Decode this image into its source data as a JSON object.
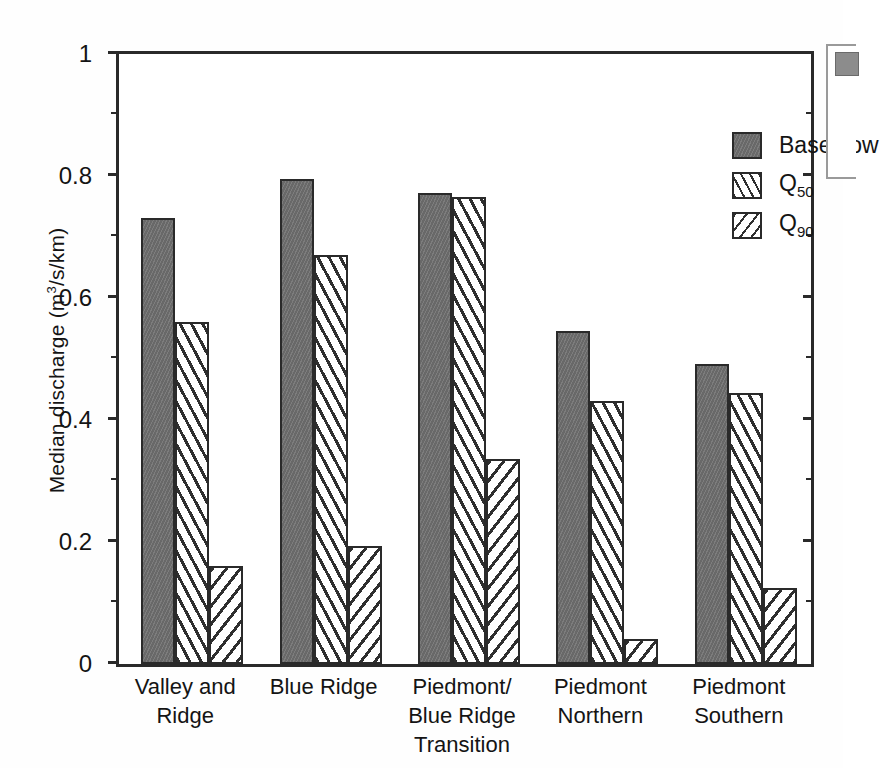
{
  "chart_data": {
    "type": "bar",
    "title": "",
    "xlabel": "",
    "ylabel": "Median discharge (m3/s/km)",
    "ylabel_parts": {
      "main": "Median discharge (m",
      "sup": "3",
      "tail": "/s/km)"
    },
    "ylim": [
      0,
      1
    ],
    "yticks": [
      0,
      0.2,
      0.4,
      0.6,
      0.8,
      1
    ],
    "ytick_labels": [
      "0",
      "0.2",
      "0.4",
      "0.6",
      "0.8",
      "1"
    ],
    "yminor_ticks": [
      0.1,
      0.3,
      0.5,
      0.7,
      0.9
    ],
    "grid": false,
    "legend_position": "top-right",
    "categories": [
      "Valley and\nRidge",
      "Blue Ridge",
      "Piedmont/\nBlue Ridge\nTransition",
      "Piedmont\nNorthern",
      "Piedmont\nSouthern"
    ],
    "category_lines": [
      [
        "Valley and",
        "Ridge"
      ],
      [
        "Blue Ridge"
      ],
      [
        "Piedmont/",
        "Blue Ridge",
        "Transition"
      ],
      [
        "Piedmont",
        "Northern"
      ],
      [
        "Piedmont",
        "Southern"
      ]
    ],
    "series": [
      {
        "name": "Base flow",
        "key": "base",
        "fill": "solid-gray",
        "color": "#6e6e6e",
        "values": [
          0.731,
          0.795,
          0.772,
          0.546,
          0.492
        ]
      },
      {
        "name": "Q50",
        "key": "q50",
        "fill": "hatch-steep",
        "color": "#ffffff",
        "values": [
          0.561,
          0.67,
          0.766,
          0.431,
          0.444
        ]
      },
      {
        "name": "Q90",
        "key": "q90",
        "fill": "hatch-shallow",
        "color": "#ffffff",
        "values": [
          0.161,
          0.193,
          0.336,
          0.041,
          0.125
        ]
      }
    ]
  },
  "legend": {
    "entries": [
      {
        "label": "Base flow",
        "sub": ""
      },
      {
        "label": "Q",
        "sub": "50"
      },
      {
        "label": "Q",
        "sub": "90"
      }
    ]
  },
  "colors": {
    "base_flow": "#6e6e6e",
    "hatch": "#2f2f2f",
    "axis": "#2a2a2a",
    "text": "#141414",
    "background": "#ffffff"
  }
}
